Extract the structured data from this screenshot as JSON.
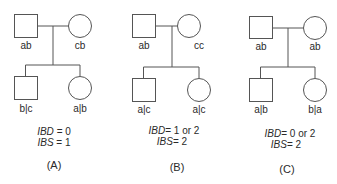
{
  "panels": [
    {
      "caption": "(A)",
      "father": "ab",
      "mother": "cb",
      "son": "b|c",
      "daughter": "a|b",
      "ibd_label": "IBD",
      "ibd_value": "= 0",
      "ibs_label": "IBS",
      "ibs_value": "= 1"
    },
    {
      "caption": "(B)",
      "father": "ab",
      "mother": "cc",
      "son": "a|c",
      "daughter": "a|c",
      "ibd_label": "IBD",
      "ibd_value": "= 1 or 2",
      "ibs_label": "IBS",
      "ibs_value": "= 2"
    },
    {
      "caption": "(C)",
      "father": "ab",
      "mother": "ab",
      "son": "a|b",
      "daughter": "b|a",
      "ibd_label": "IBD",
      "ibd_value": "= 0 or 2",
      "ibs_label": "IBS",
      "ibs_value": "= 2"
    }
  ],
  "colors": {
    "stroke": "#555555",
    "text": "#2a2a2a"
  }
}
